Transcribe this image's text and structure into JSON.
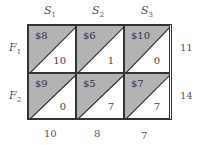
{
  "columns": [
    {
      "label": "S",
      "sub": "1"
    },
    {
      "label": "S",
      "sub": "2"
    },
    {
      "label": "S",
      "sub": "3"
    }
  ],
  "rows": [
    {
      "label": "F",
      "sub": "1",
      "supply": "11"
    },
    {
      "label": "F",
      "sub": "2",
      "supply": "14"
    }
  ],
  "demand": [
    "10",
    "8",
    "7"
  ],
  "cells": [
    [
      {
        "cost": "$8",
        "allocation": "10"
      },
      {
        "cost": "$6",
        "allocation": "1"
      },
      {
        "cost": "$10",
        "allocation": "0"
      }
    ],
    [
      {
        "cost": "$9",
        "allocation": "0"
      },
      {
        "cost": "$5",
        "allocation": "7"
      },
      {
        "cost": "$7",
        "allocation": "7"
      }
    ]
  ],
  "colors": {
    "shade": "#b3b3b3",
    "line": "#333333"
  }
}
